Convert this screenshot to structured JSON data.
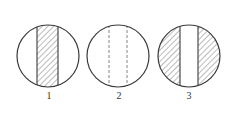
{
  "figure": {
    "stroke_color": "#3a3a3a",
    "hatch_color": "#6a6a6a",
    "dash_color": "#777777",
    "panels": [
      {
        "label": "1",
        "type": "hatched-center-band"
      },
      {
        "label": "2",
        "type": "dashed-center-band"
      },
      {
        "label": "3",
        "type": "hatched-outer-segments"
      }
    ]
  }
}
